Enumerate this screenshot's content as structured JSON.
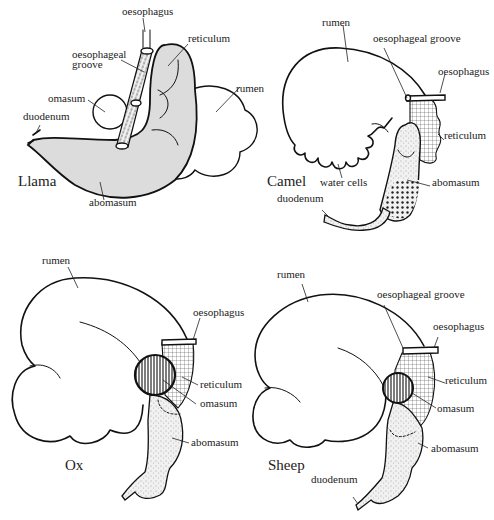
{
  "figure": {
    "panels": [
      {
        "id": "llama",
        "title": "Llama",
        "labels": {
          "oesophagus": "oesophagus",
          "reticulum": "reticulum",
          "oesophageal_groove_1": "oesophageal",
          "oesophageal_groove_2": "groove",
          "omasum": "omasum",
          "rumen": "rumen",
          "duodenum": "duodenum",
          "abomasum": "abomasum"
        }
      },
      {
        "id": "camel",
        "title": "Camel",
        "labels": {
          "rumen": "rumen",
          "oesophageal_groove": "oesophageal groove",
          "oesophagus": "oesophagus",
          "reticulum": "reticulum",
          "water_cells": "water cells",
          "abomasum": "abomasum",
          "duodenum": "duodenum"
        }
      },
      {
        "id": "ox",
        "title": "Ox",
        "labels": {
          "rumen": "rumen",
          "oesophagus": "oesophagus",
          "reticulum": "reticulum",
          "omasum": "omasum",
          "abomasum": "abomasum"
        }
      },
      {
        "id": "sheep",
        "title": "Sheep",
        "labels": {
          "rumen": "rumen",
          "oesophageal_groove": "oesophageal groove",
          "oesophagus": "oesophagus",
          "reticulum": "reticulum",
          "omasum": "omasum",
          "abomasum": "abomasum",
          "duodenum": "duodenum"
        }
      }
    ],
    "colors": {
      "ink": "#111111",
      "shading": "#dcdcdc",
      "background": "#ffffff"
    }
  }
}
